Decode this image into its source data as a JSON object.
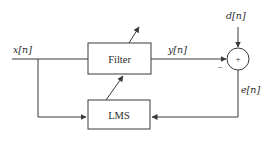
{
  "diagram": {
    "blocks": {
      "filter": {
        "label": "Filter"
      },
      "lms": {
        "label": "LMS"
      },
      "summer": {
        "plus": "+",
        "minus": "−"
      }
    },
    "signals": {
      "input": "x[n]",
      "output": "y[n]",
      "desired": "d[n]",
      "error": "e[n]"
    },
    "colors": {
      "line": "#3a3a3a",
      "text": "#2b2b2b",
      "background": "#ffffff"
    }
  }
}
